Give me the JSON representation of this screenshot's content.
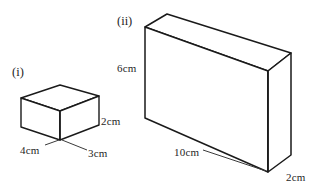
{
  "figure": {
    "background_color": "#ffffff",
    "line_color": "#1a1a1a",
    "face_color": "#ffffff",
    "shapes": [
      {
        "id": "cuboid-i",
        "index_label": "(i)",
        "type": "cuboid",
        "dimensions": {
          "width": "4cm",
          "depth": "3cm",
          "height": "2cm"
        }
      },
      {
        "id": "cuboid-ii",
        "index_label": "(ii)",
        "type": "cuboid",
        "dimensions": {
          "length": "10cm",
          "height": "6cm",
          "depth": "2cm"
        }
      }
    ]
  },
  "labels": {
    "fig_i": "(i)",
    "fig_ii": "(ii)",
    "i_width": "4cm",
    "i_depth": "3cm",
    "i_height": "2cm",
    "ii_length": "10cm",
    "ii_height": "6cm",
    "ii_depth": "2cm"
  }
}
